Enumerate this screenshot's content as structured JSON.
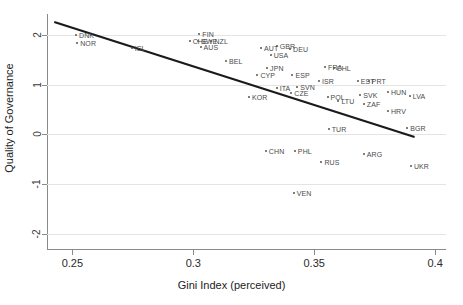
{
  "chart_data": {
    "type": "scatter",
    "title": "",
    "xlabel": "Gini Index (perceived)",
    "ylabel": "Quality of Governance",
    "xlim": [
      0.2395,
      0.4045
    ],
    "ylim": [
      -2.32,
      2.42
    ],
    "xticks": [
      0.25,
      0.3,
      0.35,
      0.4
    ],
    "xticklabels": [
      "0.25",
      "0.3",
      "0.35",
      "0.4"
    ],
    "yticks": [
      -2,
      -1,
      0,
      1,
      2
    ],
    "yticklabels": [
      "-2",
      "-1",
      "0",
      "1",
      "2"
    ],
    "grid": "horizontal",
    "legend": "none",
    "marker_color": "#555555",
    "fit_line_color": "#1a1a1a",
    "grid_color": "#e4e4e4",
    "axis_color": "#8a8a8a",
    "fit_line": {
      "label": "linear fit",
      "x": [
        0.2425,
        0.3915
      ],
      "y": [
        2.26,
        -0.05
      ]
    },
    "points": [
      {
        "label": "DNK",
        "x": 0.2515,
        "y": 1.99
      },
      {
        "label": "NOR",
        "x": 0.252,
        "y": 1.83
      },
      {
        "label": "ISL",
        "x": 0.2745,
        "y": 1.73
      },
      {
        "label": "FIN",
        "x": 0.3025,
        "y": 2.01
      },
      {
        "label": "CHE",
        "x": 0.2985,
        "y": 1.88
      },
      {
        "label": "SWE",
        "x": 0.302,
        "y": 1.88
      },
      {
        "label": "NZL",
        "x": 0.3075,
        "y": 1.88
      },
      {
        "label": "AUS",
        "x": 0.303,
        "y": 1.75
      },
      {
        "label": "BEL",
        "x": 0.3135,
        "y": 1.47
      },
      {
        "label": "AUT",
        "x": 0.328,
        "y": 1.74
      },
      {
        "label": "GBR",
        "x": 0.3345,
        "y": 1.77
      },
      {
        "label": "DEU",
        "x": 0.34,
        "y": 1.72
      },
      {
        "label": "USA",
        "x": 0.332,
        "y": 1.6
      },
      {
        "label": "JPN",
        "x": 0.3305,
        "y": 1.33
      },
      {
        "label": "CYP",
        "x": 0.3265,
        "y": 1.2
      },
      {
        "label": "FRA",
        "x": 0.3545,
        "y": 1.36
      },
      {
        "label": "CHL",
        "x": 0.358,
        "y": 1.34
      },
      {
        "label": "ESP",
        "x": 0.341,
        "y": 1.19
      },
      {
        "label": "ISR",
        "x": 0.352,
        "y": 1.07
      },
      {
        "label": "EST",
        "x": 0.368,
        "y": 1.07
      },
      {
        "label": "PRT",
        "x": 0.3725,
        "y": 1.07
      },
      {
        "label": "KOR",
        "x": 0.323,
        "y": 0.76
      },
      {
        "label": "ITA",
        "x": 0.3345,
        "y": 0.93
      },
      {
        "label": "SVN",
        "x": 0.343,
        "y": 0.95
      },
      {
        "label": "CZE",
        "x": 0.3405,
        "y": 0.84
      },
      {
        "label": "POL",
        "x": 0.3555,
        "y": 0.75
      },
      {
        "label": "LTU",
        "x": 0.36,
        "y": 0.68
      },
      {
        "label": "SVK",
        "x": 0.369,
        "y": 0.79
      },
      {
        "label": "HUN",
        "x": 0.3805,
        "y": 0.85
      },
      {
        "label": "LVA",
        "x": 0.3895,
        "y": 0.77
      },
      {
        "label": "ZAF",
        "x": 0.3705,
        "y": 0.62
      },
      {
        "label": "HRV",
        "x": 0.3805,
        "y": 0.48
      },
      {
        "label": "TUR",
        "x": 0.356,
        "y": 0.11
      },
      {
        "label": "BGR",
        "x": 0.3885,
        "y": 0.14
      },
      {
        "label": "CHN",
        "x": 0.33,
        "y": -0.34
      },
      {
        "label": "PHL",
        "x": 0.342,
        "y": -0.33
      },
      {
        "label": "ARG",
        "x": 0.3705,
        "y": -0.4
      },
      {
        "label": "RUS",
        "x": 0.353,
        "y": -0.56
      },
      {
        "label": "UKR",
        "x": 0.39,
        "y": -0.63
      },
      {
        "label": "VEN",
        "x": 0.3415,
        "y": -1.18
      }
    ]
  }
}
